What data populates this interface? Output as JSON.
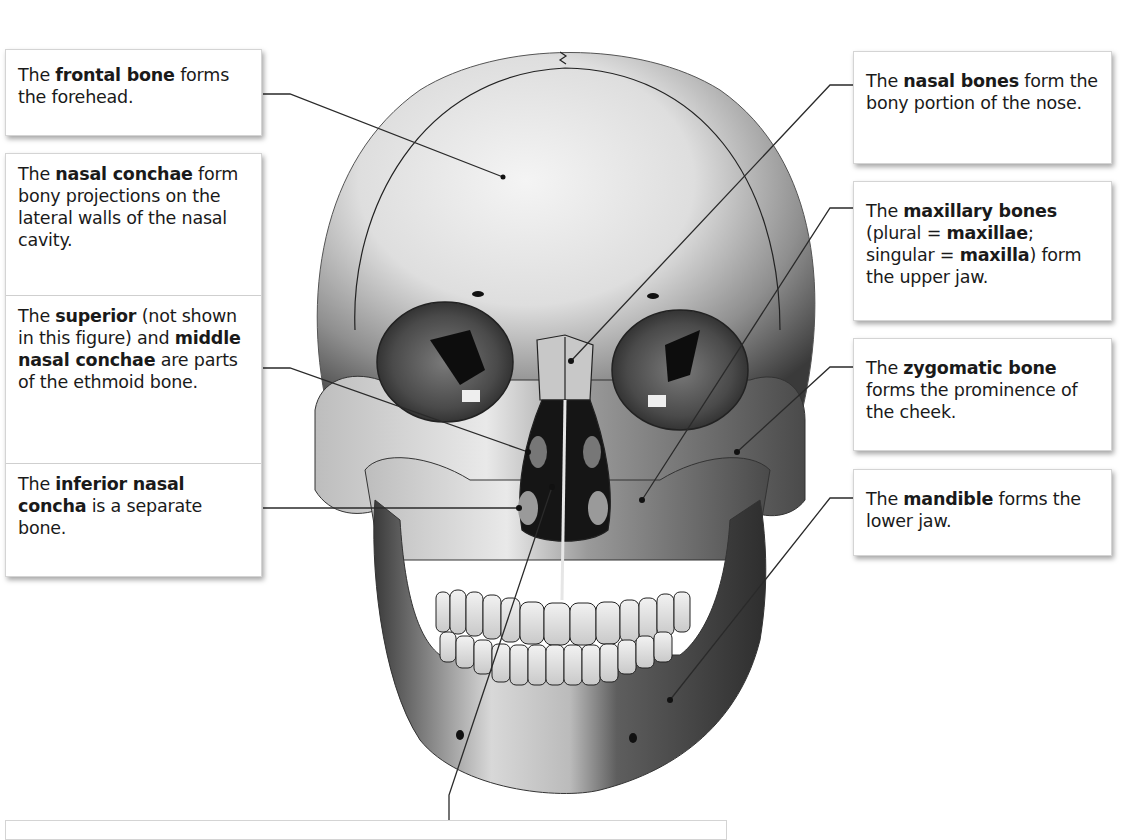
{
  "figure": {
    "colors": {
      "leader_line": "#2a2a2a",
      "box_border": "#d4d4d4",
      "text": "#1a1a1a"
    }
  },
  "labels": {
    "frontal_bone": [
      {
        "t": "The ",
        "b": false
      },
      {
        "t": "frontal bone",
        "b": true
      },
      {
        "t": " forms the forehead.",
        "b": false
      }
    ],
    "nasal_conchae": [
      {
        "t": "The ",
        "b": false
      },
      {
        "t": "nasal conchae",
        "b": true
      },
      {
        "t": " form bony projections on the lateral walls of the nasal cavity.",
        "b": false
      }
    ],
    "superior_middle_conchae": [
      {
        "t": "The ",
        "b": false
      },
      {
        "t": "superior",
        "b": true
      },
      {
        "t": " (not shown in this figure) and ",
        "b": false
      },
      {
        "t": "middle nasal conchae",
        "b": true
      },
      {
        "t": " are parts of the ethmoid bone.",
        "b": false
      }
    ],
    "inferior_nasal_concha": [
      {
        "t": "The ",
        "b": false
      },
      {
        "t": "inferior nasal concha",
        "b": true
      },
      {
        "t": " is a separate bone.",
        "b": false
      }
    ],
    "nasal_bones": [
      {
        "t": "The ",
        "b": false
      },
      {
        "t": "nasal bones",
        "b": true
      },
      {
        "t": " form the bony portion of the nose.",
        "b": false
      }
    ],
    "maxillary_bones": [
      {
        "t": "The ",
        "b": false
      },
      {
        "t": "maxillary bones",
        "b": true
      },
      {
        "t": " (plural = ",
        "b": false
      },
      {
        "t": "maxillae",
        "b": true
      },
      {
        "t": "; singular = ",
        "b": false
      },
      {
        "t": "maxilla",
        "b": true
      },
      {
        "t": ") form the upper jaw.",
        "b": false
      }
    ],
    "zygomatic_bone": [
      {
        "t": "The ",
        "b": false
      },
      {
        "t": "zygomatic bone",
        "b": true
      },
      {
        "t": " forms the prominence of the cheek.",
        "b": false
      }
    ],
    "mandible": [
      {
        "t": "The ",
        "b": false
      },
      {
        "t": "mandible",
        "b": true
      },
      {
        "t": " forms the lower jaw.",
        "b": false
      }
    ]
  }
}
